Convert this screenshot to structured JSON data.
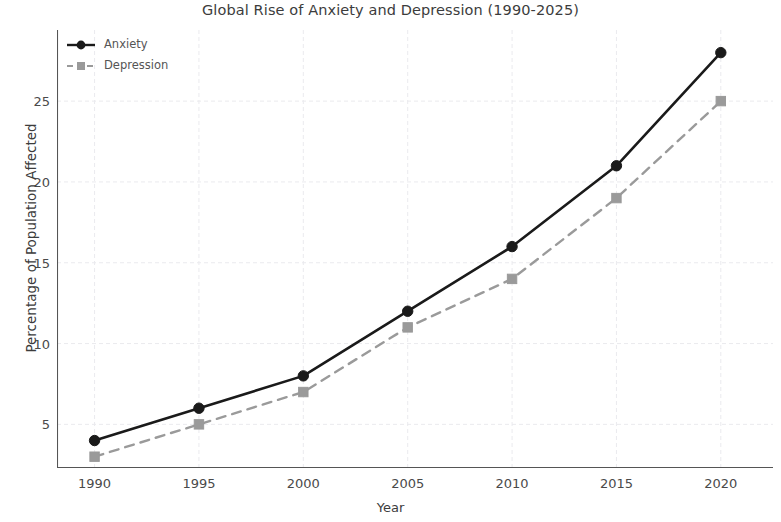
{
  "chart_data": {
    "type": "line",
    "title": "Global Rise of Anxiety and Depression (1990-2025)",
    "xlabel": "Year",
    "ylabel": "Percentage of Population Affected",
    "x": [
      1990,
      1995,
      2000,
      2005,
      2010,
      2015,
      2020
    ],
    "xticklabels": [
      "1990",
      "1995",
      "2000",
      "2005",
      "2010",
      "2015",
      "2020"
    ],
    "yticks": [
      5,
      10,
      15,
      20,
      25
    ],
    "yticklabels": [
      "5",
      "10",
      "15",
      "20",
      "25"
    ],
    "xlim": [
      1988.2,
      2022.5
    ],
    "ylim": [
      2.3,
      29.4
    ],
    "grid": true,
    "legend_position": "upper left",
    "series": [
      {
        "name": "Anxiety",
        "values": [
          4,
          6,
          8,
          12,
          16,
          21,
          28
        ],
        "color": "#1a1a1a",
        "linestyle": "solid",
        "marker": "circle"
      },
      {
        "name": "Depression",
        "values": [
          3,
          5,
          7,
          11,
          14,
          19,
          25
        ],
        "color": "#9a9a9a",
        "linestyle": "dashed",
        "marker": "square"
      }
    ]
  },
  "colors": {
    "anxiety": "#1a1a1a",
    "depression": "#9a9a9a",
    "grid": "#eaeaee",
    "axis": "#555555",
    "text": "#3c3c3c"
  }
}
